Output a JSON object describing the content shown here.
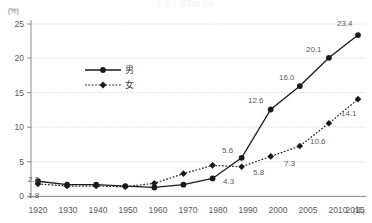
{
  "chart_data": {
    "type": "line",
    "title": "生涯未婚率の推移",
    "xlabel": "(年)",
    "ylabel": "(%)",
    "ylim": [
      0,
      25
    ],
    "yticks": [
      0,
      5,
      10,
      15,
      20,
      25
    ],
    "grid": true,
    "legend_position": "inside-left",
    "categories": [
      "1920",
      "1930",
      "1940",
      "1950",
      "1960",
      "1970",
      "1980",
      "1990",
      "2000",
      "2005",
      "2010",
      "2015"
    ],
    "series": [
      {
        "name": "男",
        "marker": "circle",
        "linestyle": "solid",
        "color": "#1a1a1a",
        "values": [
          2.2,
          1.7,
          1.7,
          1.5,
          1.3,
          1.7,
          2.6,
          5.6,
          12.6,
          16.0,
          20.1,
          23.4
        ],
        "labels": [
          "2.2",
          "",
          "",
          "",
          "",
          "",
          "",
          "5.6",
          "12.6",
          "16.0",
          "20.1",
          "23.4"
        ]
      },
      {
        "name": "女",
        "marker": "diamond",
        "linestyle": "dotted",
        "color": "#1a1a1a",
        "values": [
          1.8,
          1.5,
          1.5,
          1.4,
          1.9,
          3.3,
          4.5,
          4.3,
          5.8,
          7.3,
          10.6,
          14.1
        ],
        "labels": [
          "1.8",
          "",
          "",
          "",
          "",
          "",
          "",
          "4.3",
          "5.8",
          "7.3",
          "10.6",
          "14.1"
        ]
      }
    ]
  },
  "axis": {
    "y_unit": "(%)",
    "x_unit": "(年)",
    "y_ticks": [
      "0",
      "5",
      "10",
      "15",
      "20",
      "25"
    ],
    "x_ticks": [
      "1920",
      "1930",
      "1940",
      "1950",
      "1960",
      "1970",
      "1980",
      "1990",
      "2000",
      "2005",
      "2010",
      "2015"
    ]
  },
  "legend": {
    "male_label": "男",
    "female_label": "女"
  },
  "labels": {
    "male": {
      "y1920": "2.2",
      "y1990": "5.6",
      "y2000": "12.6",
      "y2005": "16.0",
      "y2010": "20.1",
      "y2015": "23.4"
    },
    "female": {
      "y1920": "1.8",
      "y1990": "4.3",
      "y2000": "5.8",
      "y2005": "7.3",
      "y2010": "10.6",
      "y2015": "14.1"
    }
  }
}
